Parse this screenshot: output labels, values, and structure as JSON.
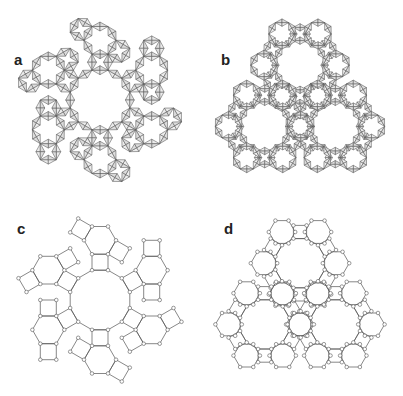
{
  "figure": {
    "panels": [
      {
        "id": "a",
        "label": "a",
        "kind": "polyhedra",
        "topology": "rosette",
        "center": [
          100,
          100
        ],
        "label_pos": [
          14,
          52
        ]
      },
      {
        "id": "b",
        "label": "b",
        "kind": "polyhedra",
        "topology": "trilobe",
        "center": [
          300,
          102
        ],
        "label_pos": [
          221,
          52
        ]
      },
      {
        "id": "c",
        "label": "c",
        "kind": "net",
        "topology": "rosette",
        "center": [
          100,
          300
        ],
        "label_pos": [
          17,
          221
        ]
      },
      {
        "id": "d",
        "label": "d",
        "kind": "net",
        "topology": "trilobe",
        "center": [
          300,
          300
        ],
        "label_pos": [
          224,
          221
        ]
      }
    ],
    "colors": {
      "line": "#555555",
      "tetra_fill": "#dcdcdc",
      "node_fill": "#ffffff",
      "label": "#222222",
      "background": "#ffffff"
    }
  }
}
